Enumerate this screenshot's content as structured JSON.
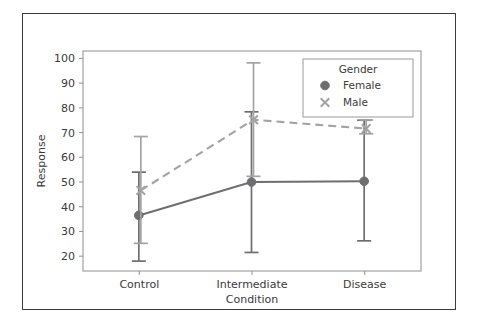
{
  "chart_data": {
    "type": "line",
    "title": "",
    "xlabel": "Condition",
    "ylabel": "Response",
    "categories": [
      "Control",
      "Intermediate",
      "Disease"
    ],
    "ylim": [
      14,
      103
    ],
    "yticks": [
      20,
      30,
      40,
      50,
      60,
      70,
      80,
      90,
      100
    ],
    "ytick_labels": [
      "20",
      "30",
      "40",
      "50",
      "60",
      "70",
      "80",
      "90",
      "100"
    ],
    "grid": false,
    "legend": {
      "title": "Gender",
      "position": "upper right",
      "entries": [
        {
          "name": "Female",
          "marker": "circle",
          "linestyle": "solid",
          "color": "#6e6e70"
        },
        {
          "name": "Male",
          "marker": "x",
          "linestyle": "dashed",
          "color": "#a3a3a5"
        }
      ]
    },
    "series": [
      {
        "name": "Female",
        "marker": "circle",
        "linestyle": "solid",
        "color": "#6e6e70",
        "values": [
          36.5,
          50.0,
          50.3
        ],
        "err_low": [
          18.0,
          21.5,
          26.2
        ],
        "err_high": [
          54.0,
          78.4,
          75.0
        ]
      },
      {
        "name": "Male",
        "marker": "x",
        "linestyle": "dashed",
        "color": "#a3a3a5",
        "values": [
          46.6,
          75.2,
          71.6
        ],
        "err_low": [
          25.2,
          52.3,
          69.5
        ],
        "err_high": [
          68.4,
          98.2,
          75.1
        ]
      }
    ]
  },
  "colors": {
    "frame": "#3c3c40",
    "axis": "#9a9a9c",
    "text": "#3a3a3a",
    "female": "#6e6e70",
    "male": "#a3a3a5",
    "background": "#ffffff"
  }
}
